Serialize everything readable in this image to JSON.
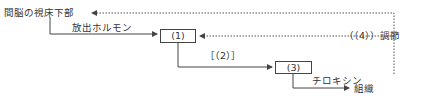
{
  "diagram": {
    "nodes": {
      "hypothalamus": "間脳の視床下部",
      "box1": "(1)",
      "box3": "(3)",
      "tissue": "組織"
    },
    "edge_labels": {
      "release_hormone": "放出ホルモン",
      "hormone2": "［（2）］",
      "thyroxine": "チロキシン",
      "feedback": "（（4））調節"
    }
  },
  "colors": {
    "line": "#444444",
    "text": "#333333"
  }
}
